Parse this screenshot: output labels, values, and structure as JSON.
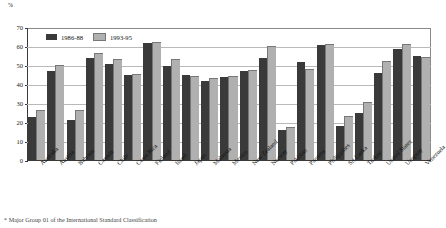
{
  "chart_data": {
    "type": "bar",
    "title": "",
    "xlabel": "",
    "ylabel": "%",
    "ylim": [
      0,
      70
    ],
    "ytick_step": 10,
    "yticks": [
      0,
      10,
      20,
      30,
      40,
      50,
      60,
      70
    ],
    "grid": true,
    "legend_position": "top-left",
    "categories": [
      "Australia",
      "Austria",
      "Bahrain",
      "Canada",
      "Chile",
      "Costa Rica",
      "Finland",
      "Israel",
      "Japan",
      "Malaysia",
      "Mexico",
      "New Zealand",
      "Norway",
      "Pakistan",
      "Panama",
      "Philippines",
      "Sri Lanka",
      "Turkey",
      "United States",
      "Uruguay",
      "Venezuela"
    ],
    "series": [
      {
        "name": "1986-88",
        "color": "#3a3a3a",
        "values": [
          23,
          47,
          21,
          54,
          51,
          45,
          62,
          50,
          45,
          42,
          44,
          47,
          54,
          16,
          52,
          61,
          18,
          25,
          46,
          59,
          55
        ]
      },
      {
        "name": "1993-95",
        "color": "#b0b0b0",
        "values": [
          26,
          50,
          26,
          56,
          53,
          45,
          62,
          53,
          44,
          43,
          44,
          47,
          60,
          17,
          48,
          61,
          23,
          30,
          52,
          61,
          54
        ]
      }
    ]
  },
  "axis": {
    "unit_label": "%"
  },
  "legend": {
    "items": [
      {
        "label": "1986-88"
      },
      {
        "label": "1993-95"
      }
    ]
  },
  "footnote": {
    "text": "* Major Group 01 of the International Standard Classification"
  }
}
